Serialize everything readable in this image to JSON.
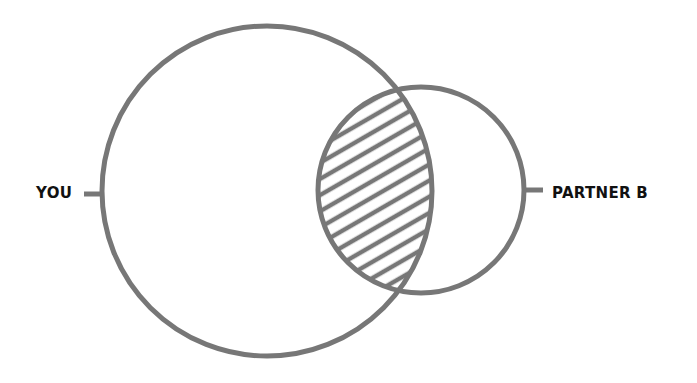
{
  "diagram": {
    "type": "venn",
    "sets": [
      {
        "id": "you",
        "label": "YOU",
        "cx": 267,
        "cy": 191,
        "r": 165
      },
      {
        "id": "partner_b",
        "label": "PARTNER B",
        "cx": 421,
        "cy": 190,
        "r": 103
      }
    ],
    "intersection": {
      "fill": "hatched",
      "description": "overlap between YOU and PARTNER B"
    },
    "colors": {
      "stroke": "#777777",
      "label": "#111111",
      "background": "#ffffff"
    }
  }
}
